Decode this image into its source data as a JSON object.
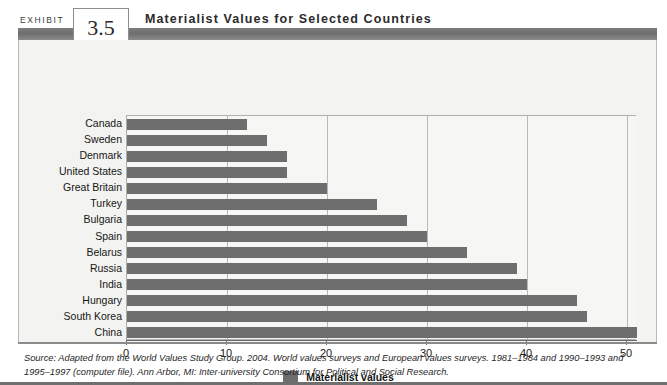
{
  "exhibit": {
    "label": "EXHIBIT",
    "number": "3.5",
    "title": "Materialist Values for Selected Countries"
  },
  "legend": {
    "label": "Materialist values",
    "swatch_color": "#6e6e6e"
  },
  "source": {
    "text": "Source: Adapted from the World Values Study Group. 2004. World values surveys and European values surveys. 1981–1984 and 1990–1993 and 1995–1997 (computer file). Ann Arbor, MI: Inter-university Consortium for Political and Social Research."
  },
  "chart_data": {
    "type": "bar",
    "orientation": "horizontal",
    "title": "Materialist Values for Selected Countries",
    "xlabel": "",
    "ylabel": "",
    "xlim": [
      0,
      51
    ],
    "xticks": [
      0,
      10,
      20,
      30,
      40,
      50
    ],
    "grid": true,
    "legend_position": "bottom-center",
    "series": [
      {
        "name": "Materialist values",
        "color": "#6e6e6e",
        "values": [
          12,
          14,
          16,
          16,
          20,
          25,
          28,
          30,
          34,
          39,
          40,
          45,
          46,
          51
        ]
      }
    ],
    "categories": [
      "Canada",
      "Sweden",
      "Denmark",
      "United States",
      "Great Britain",
      "Turkey",
      "Bulgaria",
      "Spain",
      "Belarus",
      "Russia",
      "India",
      "Hungary",
      "South Korea",
      "China"
    ]
  }
}
